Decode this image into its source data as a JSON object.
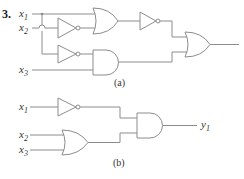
{
  "problem": {
    "number": "3.",
    "circuit_a": {
      "caption": "(a)",
      "inputs": [
        {
          "name": "x",
          "sub": "1"
        },
        {
          "name": "x",
          "sub": "2"
        },
        {
          "name": "x",
          "sub": "3"
        }
      ],
      "gates": [
        "NOT (x2)",
        "OR (x1, NOT x2)",
        "NOT (x1)",
        "AND (NOT x1, x3)",
        "NOT (OR output)",
        "OR (final)"
      ]
    },
    "circuit_b": {
      "caption": "(b)",
      "inputs": [
        {
          "name": "x",
          "sub": "1"
        },
        {
          "name": "x",
          "sub": "2"
        },
        {
          "name": "x",
          "sub": "3"
        }
      ],
      "output": {
        "name": "y",
        "sub": "1"
      },
      "gates": [
        "NOT (x1)",
        "OR (x2, x3)",
        "AND (final)"
      ]
    }
  },
  "colors": {
    "line": "#8c8c8c",
    "text": "#333333",
    "background": "#ffffff"
  }
}
